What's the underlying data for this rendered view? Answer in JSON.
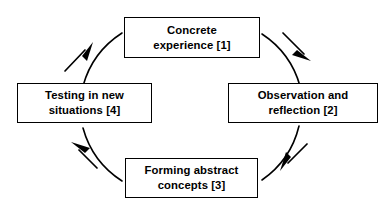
{
  "diagram": {
    "type": "cyclical-process-diagram",
    "direction": "clockwise",
    "background_color": "#ffffff",
    "line_color": "#000000",
    "text_color": "#000000",
    "nodes": [
      {
        "id": "concrete-experience",
        "label": "Concrete\nexperience [1]",
        "step": "1",
        "position": "top"
      },
      {
        "id": "observation-reflection",
        "label": "Observation and\nreflection [2]",
        "step": "2",
        "position": "right"
      },
      {
        "id": "forming-abstract-concepts",
        "label": "Forming abstract\nconcepts [3]",
        "step": "3",
        "position": "bottom"
      },
      {
        "id": "testing-new-situations",
        "label": "Testing in new\nsituations [4]",
        "step": "4",
        "position": "left"
      }
    ],
    "connectors": [
      {
        "id": "arc-top-right",
        "from": "concrete-experience",
        "to": "observation-reflection",
        "arrow_direction": "down-right"
      },
      {
        "id": "arc-bottom-right",
        "from": "observation-reflection",
        "to": "forming-abstract-concepts",
        "arrow_direction": "down-left"
      },
      {
        "id": "arc-bottom-left",
        "from": "forming-abstract-concepts",
        "to": "testing-new-situations",
        "arrow_direction": "up-left"
      },
      {
        "id": "arc-top-left",
        "from": "testing-new-situations",
        "to": "concrete-experience",
        "arrow_direction": "up-right"
      }
    ]
  }
}
